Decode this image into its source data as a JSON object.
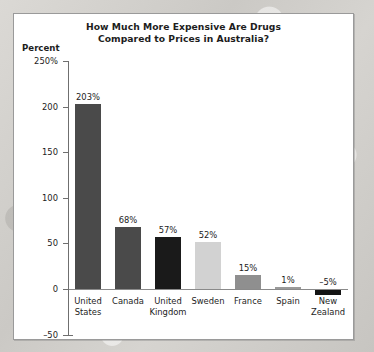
{
  "chart_data": {
    "type": "bar",
    "title": "How Much More Expensive Are Drugs Compared to Prices in Australia?",
    "title_lines": [
      "How Much More Expensive Are Drugs",
      "Compared to Prices in Australia?"
    ],
    "xlabel": "",
    "ylabel": "Percent",
    "ylim": [
      -50,
      250
    ],
    "grid": false,
    "legend": false,
    "ytick_labels": [
      "250%",
      "200",
      "150",
      "100",
      "50",
      "0",
      "-50"
    ],
    "ytick_values": [
      250,
      200,
      150,
      100,
      50,
      0,
      -50
    ],
    "categories": [
      "United States",
      "Canada",
      "United Kingdom",
      "Sweden",
      "France",
      "Spain",
      "New Zealand"
    ],
    "category_lines": [
      [
        "United",
        "States"
      ],
      [
        "Canada"
      ],
      [
        "United",
        "Kingdom"
      ],
      [
        "Sweden"
      ],
      [
        "France"
      ],
      [
        "Spain"
      ],
      [
        "New",
        "Zealand"
      ]
    ],
    "values": [
      203,
      68,
      57,
      52,
      15,
      1,
      -5
    ],
    "value_labels": [
      "203%",
      "68%",
      "57%",
      "52%",
      "15%",
      "1%",
      "-5%"
    ],
    "bar_colors": [
      "#4a4a4a",
      "#4a4a4a",
      "#1a1a1a",
      "#d2d2d2",
      "#8f8f8f",
      "#9a9a9a",
      "#141414"
    ]
  },
  "style": {
    "panel_background": "#ffffff",
    "panel_border": "#9a9a9a",
    "axis_color": "#6f6f6f",
    "text_color": "#1d1d1d",
    "page_background": "#d2d0cc"
  }
}
